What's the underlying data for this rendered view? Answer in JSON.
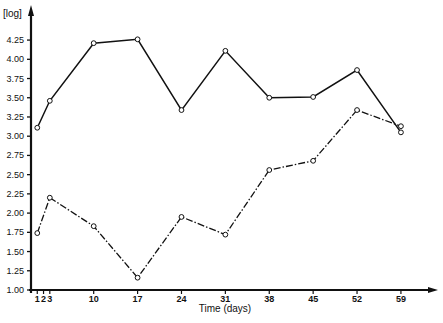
{
  "chart_data": {
    "type": "line",
    "title": "",
    "xlabel": "Time (days)",
    "ylabel": "[log]",
    "x": [
      1,
      3,
      10,
      17,
      24,
      31,
      38,
      45,
      52,
      59
    ],
    "x_ticks": [
      "1",
      "2",
      "3",
      "10",
      "17",
      "24",
      "31",
      "38",
      "45",
      "52",
      "59"
    ],
    "y_ticks": [
      "1.00",
      "1.25",
      "1.50",
      "1.75",
      "2.00",
      "2.25",
      "2.50",
      "2.75",
      "3.00",
      "3.25",
      "3.50",
      "3.75",
      "4.00",
      "4.25"
    ],
    "ylim": [
      1.0,
      4.25
    ],
    "grid": false,
    "legend": null,
    "series": [
      {
        "name": "solid",
        "style": "solid",
        "values": [
          3.11,
          3.46,
          4.21,
          4.26,
          3.34,
          4.11,
          3.5,
          3.51,
          3.86,
          3.05
        ]
      },
      {
        "name": "dash-dot",
        "style": "dash-dot",
        "values": [
          1.74,
          2.2,
          1.83,
          1.16,
          1.95,
          1.72,
          2.56,
          2.68,
          3.34,
          3.13
        ]
      }
    ]
  },
  "caption": ""
}
